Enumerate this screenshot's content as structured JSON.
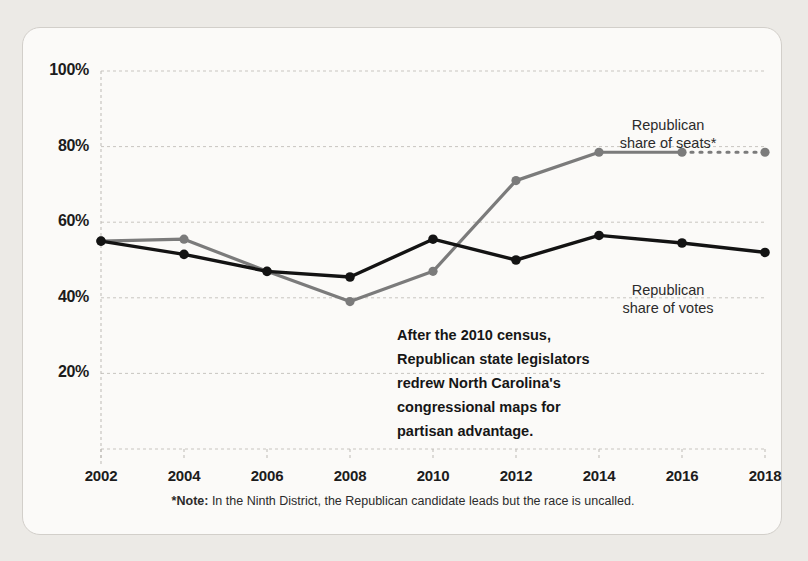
{
  "chart_data": {
    "type": "line",
    "title": "",
    "subtitle": "",
    "xlabel": "",
    "ylabel": "",
    "x": [
      2002,
      2004,
      2006,
      2008,
      2010,
      2012,
      2014,
      2016,
      2018
    ],
    "xticklabels": [
      "2002",
      "2004",
      "2006",
      "2008",
      "2010",
      "2012",
      "2014",
      "2016",
      "2018"
    ],
    "yticklabels": [
      "20%",
      "40%",
      "60%",
      "80%",
      "100%"
    ],
    "yticks": [
      20,
      40,
      60,
      80,
      100
    ],
    "ylim": [
      0,
      100
    ],
    "xlim": [
      2002,
      2018
    ],
    "grid": true,
    "legend_position": "inline-right",
    "series": [
      {
        "name": "Republican share of seats*",
        "color": "#7b7b7b",
        "values": [
          55,
          55.5,
          47,
          39,
          47,
          71,
          78.5,
          78.5,
          78.5
        ],
        "dashed_from_index": 7
      },
      {
        "name": "Republican share of votes",
        "color": "#131313",
        "values": [
          55,
          51.5,
          47,
          45.5,
          55.5,
          50,
          56.5,
          54.5,
          52
        ],
        "dashed_from_index": null
      }
    ],
    "annotations": [
      {
        "name": "census-annotation",
        "lines": [
          "After the 2010 census,",
          "Republican state legislators",
          "redrew North Carolina's",
          "congressional maps for",
          "partisan advantage."
        ]
      }
    ]
  },
  "labels": {
    "seats_line1": "Republican",
    "seats_line2": "share of seats*",
    "votes_line1": "Republican",
    "votes_line2": "share of votes"
  },
  "footnote": {
    "marker": "*Note:",
    "text": " In the Ninth District, the Republican candidate leads but the race is uncalled."
  },
  "colors": {
    "seats": "#7b7b7b",
    "votes": "#131313",
    "grid": "#c8c5c0",
    "axis": "#bdbab5",
    "card_bg": "#fbfaf8",
    "page_bg": "#eceae6",
    "text": "#1c1c1c"
  }
}
